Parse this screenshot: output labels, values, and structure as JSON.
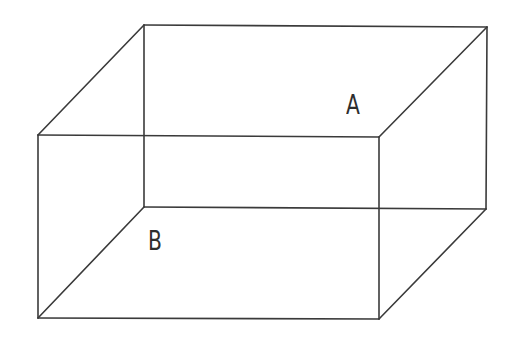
{
  "diagram": {
    "type": "3d-box-wireframe",
    "edge_color": "#3a3a3a",
    "vertices": {
      "back_top_left": [
        144,
        25
      ],
      "back_top_right": [
        487,
        27
      ],
      "back_bottom_left": [
        144,
        207
      ],
      "back_bottom_right": [
        486,
        209
      ],
      "front_top_left": [
        38,
        135
      ],
      "front_top_right": [
        379,
        137
      ],
      "front_bottom_left": [
        38,
        318
      ],
      "front_bottom_right": [
        379,
        319
      ]
    },
    "labels": [
      {
        "id": "A",
        "text": "A",
        "x": 346,
        "y": 92,
        "location": "top face"
      },
      {
        "id": "B",
        "text": "B",
        "x": 148,
        "y": 228,
        "location": "bottom face"
      }
    ]
  }
}
